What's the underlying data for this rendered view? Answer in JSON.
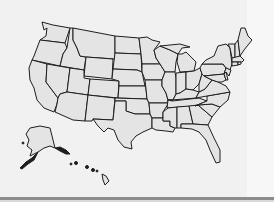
{
  "map": {
    "type": "us-states-outline",
    "colors": {
      "background": "#f1f1f1",
      "state_fill": "#e4e4e4",
      "state_stroke": "#1e1e1e",
      "bottom_bar": "#8c8c8c"
    },
    "regions": [
      "contiguous-us",
      "alaska",
      "hawaii"
    ],
    "labels": []
  }
}
